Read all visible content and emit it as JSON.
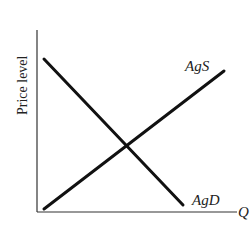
{
  "diagram": {
    "y_axis_label": "Price level",
    "x_axis_label": "Q",
    "curves": [
      {
        "name": "AgS",
        "label": "AgS",
        "slope": "upward"
      },
      {
        "name": "AgD",
        "label": "AgD",
        "slope": "downward"
      }
    ],
    "colors": {
      "line": "#111111",
      "axis": "#333333",
      "text": "#222222",
      "background": "#ffffff"
    }
  }
}
